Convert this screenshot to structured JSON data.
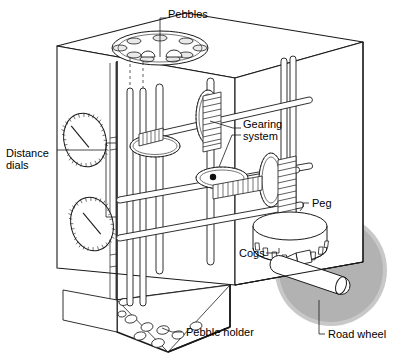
{
  "figure": {
    "domain": "technical-cutaway-illustration",
    "background_color": "#ffffff",
    "line_color": "#1a1a1a",
    "wheel_color": "#b3b3b3",
    "wheel_rim_color": "#c6c6c6",
    "face_fill": "#ffffff"
  },
  "labels": [
    {
      "id": "pebbles",
      "text": "Pebbles",
      "x": 168,
      "y": 14,
      "anchor": "start",
      "lines": [
        "Pebbles"
      ]
    },
    {
      "id": "gearing",
      "text": "Gearing system",
      "x": 243,
      "y": 124,
      "anchor": "start",
      "lines": [
        "Gearing",
        "system"
      ]
    },
    {
      "id": "distance",
      "text": "Distance dials",
      "x": 8,
      "y": 152,
      "anchor": "start",
      "lines": [
        "Distance",
        "dials"
      ]
    },
    {
      "id": "peg",
      "text": "Peg",
      "x": 311,
      "y": 199,
      "anchor": "start",
      "lines": [
        "Peg"
      ]
    },
    {
      "id": "cogs",
      "text": "Cogs",
      "x": 241,
      "y": 256,
      "anchor": "start",
      "lines": [
        "Cogs"
      ]
    },
    {
      "id": "pebble-holder",
      "text": "Pebble holder",
      "x": 185,
      "y": 334,
      "anchor": "start",
      "lines": [
        "Pebble holder"
      ]
    },
    {
      "id": "road-wheel",
      "text": "Road wheel",
      "x": 327,
      "y": 337,
      "anchor": "start",
      "lines": [
        "Road wheel"
      ]
    }
  ],
  "parts": {
    "cabinet": "cut-away rectangular case shown in axonometric view",
    "top_disc": "circular pebble dispenser plate with ten holes",
    "dials": [
      {
        "id": "upper-dial",
        "cx": 85,
        "cy": 140,
        "rx": 21,
        "ry": 27
      },
      {
        "id": "lower-dial",
        "cx": 90,
        "cy": 224,
        "rx": 21,
        "ry": 27
      }
    ],
    "gears": [
      {
        "id": "gear-upper-left",
        "cx": 155,
        "cy": 143,
        "rx": 24,
        "ry": 11
      },
      {
        "id": "gear-upper-right",
        "cx": 208,
        "cy": 117,
        "rx": 12,
        "ry": 26
      },
      {
        "id": "gear-middle",
        "cx": 222,
        "cy": 178,
        "rx": 24,
        "ry": 11
      },
      {
        "id": "gear-right",
        "cx": 271,
        "cy": 180,
        "rx": 12,
        "ry": 26
      }
    ],
    "worms": [
      {
        "id": "worm-upper",
        "x": 210,
        "y": 100
      },
      {
        "id": "worm-mid",
        "x": 222,
        "y": 185
      },
      {
        "id": "worm-right",
        "x": 285,
        "y": 170
      }
    ],
    "cog_drum": {
      "id": "cog-drum",
      "cx": 290,
      "cy": 226,
      "rx": 37,
      "ry": 14,
      "height": 22
    },
    "road_wheel": {
      "id": "road-wheel",
      "cx": 331,
      "cy": 270,
      "r": 56
    },
    "axle": {
      "id": "road-wheel-axle",
      "from": [
        289,
        252
      ],
      "to": [
        352,
        277
      ]
    },
    "pebble_holder": "sloped tray at base holding loose pebbles"
  }
}
